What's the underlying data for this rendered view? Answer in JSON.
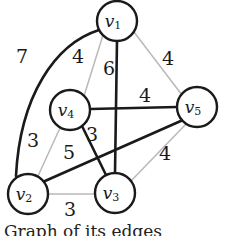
{
  "figure": {
    "caption": "Graph of its edges",
    "background_color": "#ffffff",
    "bold_edge_color": "#1a1a1a",
    "light_edge_color": "#b9b9b9",
    "node_fill_color": "#ffffff",
    "node_stroke_color": "#1a1a1a"
  },
  "nodes": [
    {
      "id": "v1",
      "label": "v",
      "sub": "1",
      "cx": 117,
      "cy": 21,
      "r": 20
    },
    {
      "id": "v4",
      "label": "v",
      "sub": "4",
      "cx": 70,
      "cy": 110,
      "r": 20
    },
    {
      "id": "v5",
      "label": "v",
      "sub": "5",
      "cx": 197,
      "cy": 107,
      "r": 20
    },
    {
      "id": "v2",
      "label": "v",
      "sub": "2",
      "cx": 28,
      "cy": 194,
      "r": 20
    },
    {
      "id": "v3",
      "label": "v",
      "sub": "3",
      "cx": 115,
      "cy": 193,
      "r": 20
    }
  ],
  "edges": [
    {
      "id": "e-v1-v2",
      "from": "v1",
      "to": "v2",
      "weight": "7",
      "style": "bold",
      "curved": true,
      "label_x": 22,
      "label_y": 58
    },
    {
      "id": "e-v1-v4",
      "from": "v1",
      "to": "v4",
      "weight": "4",
      "style": "light",
      "curved": false,
      "label_x": 78,
      "label_y": 58
    },
    {
      "id": "e-v1-v3",
      "from": "v1",
      "to": "v3",
      "weight": "6",
      "style": "bold",
      "curved": false,
      "label_x": 109,
      "label_y": 70
    },
    {
      "id": "e-v1-v5",
      "from": "v1",
      "to": "v5",
      "weight": "4",
      "style": "light",
      "curved": false,
      "label_x": 168,
      "label_y": 60
    },
    {
      "id": "e-v4-v5",
      "from": "v4",
      "to": "v5",
      "weight": "4",
      "style": "bold",
      "curved": false,
      "label_x": 145,
      "label_y": 97
    },
    {
      "id": "e-v4-v3",
      "from": "v4",
      "to": "v3",
      "weight": "3",
      "style": "bold",
      "curved": false,
      "label_x": 92,
      "label_y": 136
    },
    {
      "id": "e-v4-v2",
      "from": "v4",
      "to": "v2",
      "weight": "3",
      "style": "light",
      "curved": false,
      "label_x": 33,
      "label_y": 142
    },
    {
      "id": "e-v2-v5",
      "from": "v2",
      "to": "v5",
      "weight": "5",
      "style": "bold",
      "curved": false,
      "label_x": 69,
      "label_y": 154
    },
    {
      "id": "e-v2-v3",
      "from": "v2",
      "to": "v3",
      "weight": "3",
      "style": "light",
      "curved": false,
      "label_x": 70,
      "label_y": 211
    },
    {
      "id": "e-v3-v5",
      "from": "v3",
      "to": "v5",
      "weight": "4",
      "style": "light",
      "curved": false,
      "label_x": 165,
      "label_y": 155
    }
  ],
  "curve_paths": {
    "e-v1-v2": "M 99 30 C 55 44 22 96 17 175"
  }
}
